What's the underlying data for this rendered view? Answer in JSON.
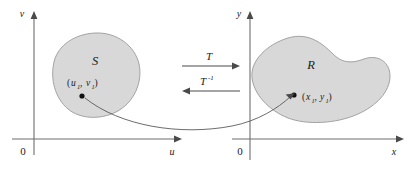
{
  "figure": {
    "kind": "coordinate-transformation-diagram",
    "background_color": "#ffffff",
    "region_fill_color": "#d8d8d8",
    "region_stroke_color": "#9a9a9a",
    "axis_color": "#6e6e6e",
    "text_color": "#1a1a1a"
  },
  "left_plane": {
    "name": "uv-plane",
    "vertical_axis_label": "v",
    "horizontal_axis_label": "u",
    "origin_label": "0",
    "region_label": "S",
    "point_label_open": "(",
    "point_label_var1": "u",
    "point_label_sub1": "1",
    "point_label_comma": ", ",
    "point_label_var2": "v",
    "point_label_sub2": "1",
    "point_label_close": ")",
    "point_label_full": "(u1, v1)"
  },
  "right_plane": {
    "name": "xy-plane",
    "vertical_axis_label": "y",
    "horizontal_axis_label": "x",
    "origin_label": "0",
    "region_label": "R",
    "point_label_open": "(",
    "point_label_var1": "x",
    "point_label_sub1": "1",
    "point_label_comma": ", ",
    "point_label_var2": "y",
    "point_label_sub2": "1",
    "point_label_close": ")",
    "point_label_full": "(x1, y1)"
  },
  "mappings": {
    "forward_label": "T",
    "forward_direction": "right",
    "inverse_label_base": "T",
    "inverse_label_exponent": "-1",
    "inverse_label_full": "T-1",
    "inverse_direction": "left"
  }
}
